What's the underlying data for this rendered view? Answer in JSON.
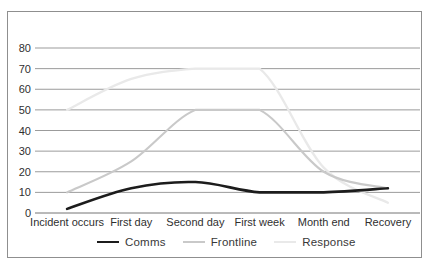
{
  "frame": {
    "background": "#ffffff",
    "border_color": "#8f8f8f"
  },
  "chart_data": {
    "type": "line",
    "title": "",
    "categories": [
      "Incident occurs",
      "First day",
      "Second day",
      "First week",
      "Month end",
      "Recovery"
    ],
    "series": [
      {
        "name": "Comms",
        "color": "#1c1c1c",
        "stroke_width": 2.6,
        "values": [
          2,
          12,
          15,
          10,
          10,
          12
        ]
      },
      {
        "name": "Frontline",
        "color": "#c9c9c9",
        "stroke_width": 2.1,
        "values": [
          10,
          25,
          50,
          50,
          20,
          12
        ]
      },
      {
        "name": "Response",
        "color": "#e9e9e9",
        "stroke_width": 2.3,
        "values": [
          50,
          65,
          70,
          70,
          22,
          5
        ]
      }
    ],
    "y_ticks": [
      80,
      70,
      60,
      50,
      40,
      30,
      20,
      10,
      0
    ],
    "ylim": [
      0,
      80
    ],
    "xlabel": "",
    "ylabel": "",
    "grid": "horizontal",
    "gridline_color": "#9b9b9b",
    "zero_line_color": "#757575",
    "tick_label_color": "#2f2f2f",
    "legend_position": "bottom"
  }
}
